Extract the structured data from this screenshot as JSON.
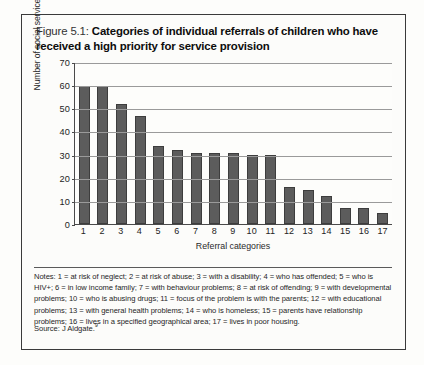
{
  "figure": {
    "label": "Figure 5.1:",
    "title": "Categories of individual referrals of children who have received a high priority for service provision"
  },
  "notes": {
    "text": "Notes: 1 = at risk of neglect; 2 = at risk of abuse; 3 = with a disability; 4 = who has offended; 5 = who is HIV+; 6 = in low income family; 7 = with behaviour problems; 8 = at risk of offending; 9 = with developmental problems; 10 = who is abusing drugs; 11 = focus of the problem is with the parents; 12 = with educational problems; 13 = with general health problems; 14 = who is homeless; 15 = parents have relationship problems; 16 = lives in a specified geographical area; 17 = lives in poor housing."
  },
  "source": {
    "prefix": "Source: J Aldgate.",
    "footnote": "9"
  },
  "chart_data": {
    "type": "bar",
    "title": "Categories of individual referrals of children who have received a high priority for service provision",
    "xlabel": "Referral categories",
    "ylabel": "Number of social services departments",
    "categories": [
      "1",
      "2",
      "3",
      "4",
      "5",
      "6",
      "7",
      "8",
      "9",
      "10",
      "11",
      "12",
      "13",
      "14",
      "15",
      "16",
      "17"
    ],
    "values": [
      60,
      60,
      52,
      47,
      34,
      32,
      31,
      31,
      31,
      30,
      30,
      16,
      15,
      12,
      7,
      7,
      5
    ],
    "ylim": [
      0,
      70
    ],
    "yticks": [
      0,
      10,
      20,
      30,
      40,
      50,
      60,
      70
    ],
    "grid": true,
    "legend": "none",
    "series_color": "#5c5c5c",
    "category_legend": [
      "1 = at risk of neglect",
      "2 = at risk of abuse",
      "3 = with a disability",
      "4 = who has offended",
      "5 = who is HIV+",
      "6 = in low income family",
      "7 = with behaviour problems",
      "8 = at risk of offending",
      "9 = with developmental problems",
      "10 = who is abusing drugs",
      "11 = focus of the problem is with the parents",
      "12 = with educational problems",
      "13 = with general health problems",
      "14 = who is homeless",
      "15 = parents have relationship problems",
      "16 = lives in a specified geographical area",
      "17 = lives in poor housing"
    ]
  }
}
